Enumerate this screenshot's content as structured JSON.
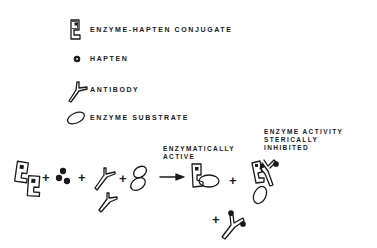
{
  "legend": {
    "items": [
      {
        "icon": "enzyme-hapten-conjugate-icon",
        "label": "ENZYME-HAPTEN CONJUGATE"
      },
      {
        "icon": "hapten-icon",
        "label": "HAPTEN"
      },
      {
        "icon": "antibody-icon",
        "label": "ANTIBODY"
      },
      {
        "icon": "enzyme-substrate-icon",
        "label": "ENZYME SUBSTRATE"
      }
    ]
  },
  "reaction": {
    "plus_sign": "+",
    "active_label": "ENZYMATICALLY\nACTIVE",
    "inhibited_label": "ENZYME ACTIVITY\nSTERICALLY\nINHIBITED"
  },
  "colors": {
    "ink": "#1a1a1a",
    "background": "#ffffff"
  }
}
